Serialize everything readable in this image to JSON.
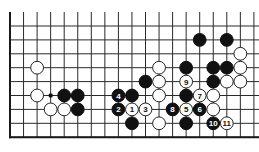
{
  "diagram": {
    "type": "go-board-fragment",
    "columns": 19,
    "rows_visible": 9,
    "open_top": true,
    "bottom_edge": true,
    "left_edge": true,
    "right_edge": false,
    "colors": {
      "black": "#111111",
      "white": "#ffffff",
      "line": "#2a2a2a"
    },
    "stones": [
      {
        "color": "black",
        "col": 14,
        "row": 1,
        "label": ""
      },
      {
        "color": "black",
        "col": 16,
        "row": 1,
        "label": ""
      },
      {
        "color": "white",
        "col": 17,
        "row": 2,
        "label": ""
      },
      {
        "color": "white",
        "col": 2,
        "row": 3,
        "label": ""
      },
      {
        "color": "white",
        "col": 11,
        "row": 3,
        "label": ""
      },
      {
        "color": "black",
        "col": 13,
        "row": 3,
        "label": ""
      },
      {
        "color": "black",
        "col": 15,
        "row": 3,
        "label": ""
      },
      {
        "color": "black",
        "col": 16,
        "row": 3,
        "label": ""
      },
      {
        "color": "white",
        "col": 17,
        "row": 3,
        "label": ""
      },
      {
        "color": "black",
        "col": 10,
        "row": 4,
        "label": ""
      },
      {
        "color": "white",
        "col": 11,
        "row": 4,
        "label": ""
      },
      {
        "color": "white",
        "col": 13,
        "row": 4,
        "label": "9"
      },
      {
        "color": "black",
        "col": 15,
        "row": 4,
        "label": ""
      },
      {
        "color": "white",
        "col": 16,
        "row": 4,
        "label": ""
      },
      {
        "color": "white",
        "col": 17,
        "row": 4,
        "label": ""
      },
      {
        "color": "white",
        "col": 2,
        "row": 5,
        "label": ""
      },
      {
        "color": "black",
        "col": 4,
        "row": 5,
        "label": ""
      },
      {
        "color": "black",
        "col": 5,
        "row": 5,
        "label": ""
      },
      {
        "color": "black",
        "col": 8,
        "row": 5,
        "label": "4"
      },
      {
        "color": "black",
        "col": 9,
        "row": 5,
        "label": ""
      },
      {
        "color": "white",
        "col": 11,
        "row": 5,
        "label": ""
      },
      {
        "color": "black",
        "col": 13,
        "row": 5,
        "label": ""
      },
      {
        "color": "white",
        "col": 14,
        "row": 5,
        "label": "7"
      },
      {
        "color": "white",
        "col": 15,
        "row": 5,
        "label": ""
      },
      {
        "color": "white",
        "col": 3,
        "row": 6,
        "label": ""
      },
      {
        "color": "white",
        "col": 4,
        "row": 6,
        "label": ""
      },
      {
        "color": "black",
        "col": 5,
        "row": 6,
        "label": ""
      },
      {
        "color": "black",
        "col": 8,
        "row": 6,
        "label": "2"
      },
      {
        "color": "white",
        "col": 9,
        "row": 6,
        "label": "1"
      },
      {
        "color": "white",
        "col": 10,
        "row": 6,
        "label": "3"
      },
      {
        "color": "black",
        "col": 12,
        "row": 6,
        "label": "8"
      },
      {
        "color": "white",
        "col": 13,
        "row": 6,
        "label": "5"
      },
      {
        "color": "black",
        "col": 14,
        "row": 6,
        "label": "6"
      },
      {
        "color": "white",
        "col": 15,
        "row": 6,
        "label": ""
      },
      {
        "color": "black",
        "col": 9,
        "row": 7,
        "label": ""
      },
      {
        "color": "white",
        "col": 11,
        "row": 7,
        "label": ""
      },
      {
        "color": "black",
        "col": 13,
        "row": 7,
        "label": ""
      },
      {
        "color": "black",
        "col": 15,
        "row": 7,
        "label": "10"
      },
      {
        "color": "white",
        "col": 16,
        "row": 7,
        "label": "11"
      }
    ],
    "markers": [
      {
        "type": "dot",
        "col": 3,
        "row": 5
      }
    ]
  }
}
